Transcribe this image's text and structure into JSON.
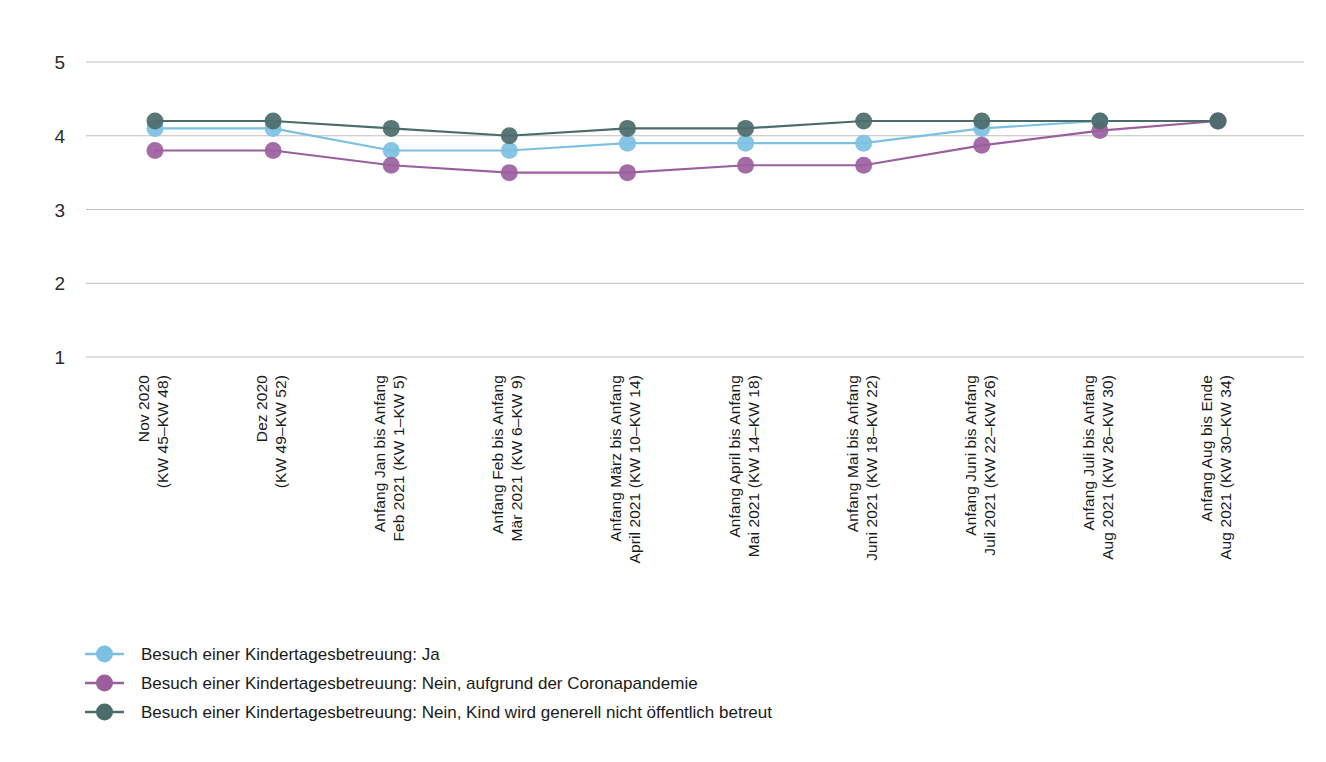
{
  "chart_data": {
    "type": "line",
    "title": "",
    "subtitle": "",
    "xlabel": "",
    "ylabel": "",
    "ylim": [
      1,
      5
    ],
    "yticks": [
      5,
      4,
      3,
      2,
      1
    ],
    "grid": true,
    "legend_position": "bottom-left",
    "categories": [
      "Nov 2020\n(KW 45–KW 48)",
      "Dez 2020\n(KW 49–KW 52)",
      "Anfang Jan bis Anfang\nFeb 2021 (KW 1–KW 5)",
      "Anfang Feb bis Anfang\nMär 2021 (KW 6–KW 9)",
      "Anfang März bis Anfang\nApril 2021 (KW 10–KW 14)",
      "Anfang April bis Anfang\nMai 2021 (KW 14–KW 18)",
      "Anfang Mai bis Anfang\nJuni 2021 (KW 18–KW 22)",
      "Anfang Juni bis Anfang\nJuli 2021 (KW 22–KW 26)",
      "Anfang Juli bis Anfang\nAug 2021 (KW 26–KW 30)",
      "Anfang Aug bis Ende\nAug 2021 (KW 30–KW 34)"
    ],
    "categories_lines": [
      [
        "Nov 2020",
        "(KW 45–KW 48)"
      ],
      [
        "Dez 2020",
        "(KW 49–KW 52)"
      ],
      [
        "Anfang Jan bis Anfang",
        "Feb 2021 (KW 1–KW 5)"
      ],
      [
        "Anfang Feb bis Anfang",
        "Mär 2021 (KW 6–KW 9)"
      ],
      [
        "Anfang März bis Anfang",
        "April 2021 (KW 10–KW 14)"
      ],
      [
        "Anfang April bis Anfang",
        "Mai 2021 (KW 14–KW 18)"
      ],
      [
        "Anfang Mai bis Anfang",
        "Juni 2021 (KW 18–KW 22)"
      ],
      [
        "Anfang Juni bis Anfang",
        "Juli 2021 (KW 22–KW 26)"
      ],
      [
        "Anfang Juli bis Anfang",
        "Aug 2021 (KW 26–KW 30)"
      ],
      [
        "Anfang Aug bis Ende",
        "Aug 2021 (KW 30–KW 34)"
      ]
    ],
    "series": [
      {
        "name": "Besuch einer Kindertagesbetreuung: Ja",
        "color": "#7cc0e2",
        "values": [
          4.1,
          4.1,
          3.8,
          3.8,
          3.9,
          3.9,
          3.9,
          4.1,
          4.2,
          4.2
        ]
      },
      {
        "name": "Besuch einer Kindertagesbetreuung: Nein, aufgrund der Coronapandemie",
        "color": "#9c5f9e",
        "values": [
          3.8,
          3.8,
          3.6,
          3.5,
          3.5,
          3.6,
          3.6,
          3.87,
          4.07,
          4.2
        ]
      },
      {
        "name": "Besuch einer Kindertagesbetreuung: Nein, Kind wird generell nicht öffentlich betreut",
        "color": "#4c6b6b",
        "values": [
          4.2,
          4.2,
          4.1,
          4.0,
          4.1,
          4.1,
          4.2,
          4.2,
          4.2,
          4.2
        ]
      }
    ]
  },
  "axis": {
    "y_tick_labels": [
      "5",
      "4",
      "3",
      "2",
      "1"
    ]
  },
  "legend": {
    "items": [
      {
        "label": "Besuch einer Kindertagesbetreuung: Ja",
        "color": "#7cc0e2"
      },
      {
        "label": "Besuch einer Kindertagesbetreuung: Nein, aufgrund der Coronapandemie",
        "color": "#9c5f9e"
      },
      {
        "label": "Besuch einer Kindertagesbetreuung: Nein, Kind wird generell nicht öffentlich betreut",
        "color": "#4c6b6b"
      }
    ]
  }
}
